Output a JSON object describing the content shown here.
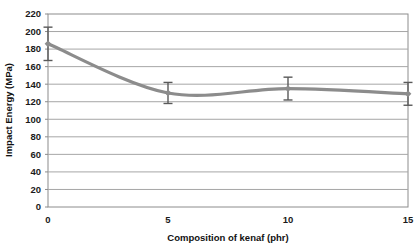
{
  "chart_data": {
    "type": "line",
    "title": "",
    "xlabel": "Composition of kenaf (phr)",
    "ylabel": "Impact Energy (MPa)",
    "x": [
      0,
      5,
      10,
      15
    ],
    "values": [
      186,
      130,
      135,
      129
    ],
    "error_low": [
      167,
      118,
      122,
      116
    ],
    "error_high": [
      205,
      142,
      148,
      142
    ],
    "error_minus": [
      19,
      12,
      13,
      13
    ],
    "error_plus": [
      19,
      12,
      13,
      13
    ],
    "series": [
      {
        "name": "Impact Energy",
        "values": [
          186,
          130,
          135,
          129
        ]
      }
    ],
    "xlim": [
      0,
      15
    ],
    "ylim": [
      0,
      220
    ],
    "xticks": [
      0,
      5,
      10,
      15
    ],
    "yticks": [
      0,
      20,
      40,
      60,
      80,
      100,
      120,
      140,
      160,
      180,
      200,
      220
    ],
    "xtick_labels": [
      "0",
      "5",
      "10",
      "15"
    ],
    "ytick_labels": [
      "0",
      "20",
      "40",
      "60",
      "80",
      "100",
      "120",
      "140",
      "160",
      "180",
      "200",
      "220"
    ],
    "grid": "horizontal",
    "legend": "none",
    "line_color": "#8c8c8c",
    "marker": "diamond",
    "marker_color": "#8c8c8c",
    "errorbar_color": "#595959",
    "grid_color": "#a6a6a6",
    "axis_color": "#8c8c8c",
    "background": "#ffffff",
    "smooth": true,
    "curve_minimum_approx": {
      "x": 6,
      "y": 127
    }
  }
}
